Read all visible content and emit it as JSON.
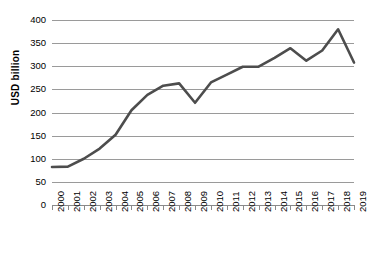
{
  "chart_data": {
    "type": "line",
    "title": "",
    "subtitle": "",
    "xlabel": "",
    "ylabel": "USD billion",
    "categories": [
      "2000",
      "2001",
      "2002",
      "2003",
      "2004",
      "2005",
      "2006",
      "2007",
      "2008",
      "2009",
      "2010",
      "2011",
      "2012",
      "2013",
      "2014",
      "2015",
      "2016",
      "2017",
      "2018",
      "2019"
    ],
    "values": [
      82,
      83,
      100,
      122,
      152,
      205,
      238,
      258,
      263,
      221,
      265,
      282,
      299,
      299,
      318,
      339,
      312,
      334,
      380,
      308
    ],
    "series": [
      {
        "name": "USD billion",
        "values": [
          82,
          83,
          100,
          122,
          152,
          205,
          238,
          258,
          263,
          221,
          265,
          282,
          299,
          299,
          318,
          339,
          312,
          334,
          380,
          308
        ]
      }
    ],
    "ylim": [
      0,
      400
    ],
    "y_ticks": [
      0,
      50,
      100,
      150,
      200,
      250,
      300,
      350,
      400
    ],
    "y_tick_labels": [
      "0",
      "50",
      "100",
      "150",
      "200",
      "250",
      "300",
      "350",
      "400"
    ],
    "x_tick_labels": [
      "2000",
      "2001",
      "2002",
      "2003",
      "2004",
      "2005",
      "2006",
      "2007",
      "2008",
      "2009",
      "2010",
      "2011",
      "2012",
      "2013",
      "2014",
      "2015",
      "2016",
      "2017",
      "2018",
      "2019"
    ],
    "grid": true,
    "grid_axis": "y",
    "legend": false,
    "legend_position": "none",
    "annotations": [],
    "line_color": "#4d4d4d",
    "grid_color": "#9a9a9a",
    "background_color": "#ffffff",
    "text_color": "#000000"
  }
}
